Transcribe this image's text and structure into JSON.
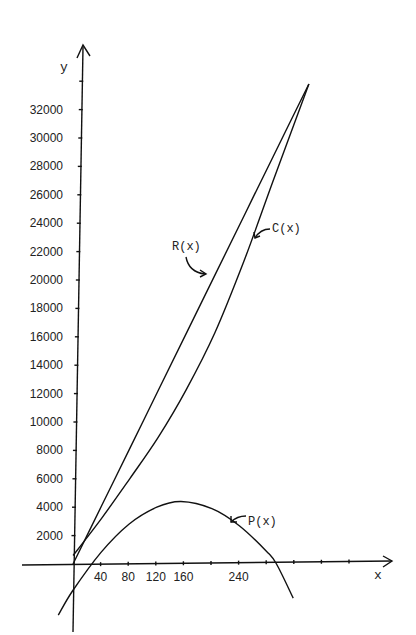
{
  "chart_data": {
    "type": "line",
    "title": "",
    "xlabel": "x",
    "ylabel": "y",
    "x_ticks": [
      40,
      80,
      120,
      160,
      240
    ],
    "x_tick_marks": [
      40,
      80,
      120,
      160,
      200,
      240,
      280,
      320,
      360,
      400
    ],
    "y_ticks": [
      2000,
      4000,
      6000,
      8000,
      10000,
      12000,
      14000,
      16000,
      18000,
      20000,
      22000,
      24000,
      26000,
      28000,
      30000,
      32000
    ],
    "xlim": [
      -25,
      430
    ],
    "ylim": [
      -4800,
      37000
    ],
    "grid": false,
    "legend": "inline curve annotations with arrows",
    "series": [
      {
        "name": "R(x)",
        "x": [
          0,
          40,
          80,
          120,
          160,
          200,
          240,
          280,
          330
        ],
        "values": [
          0,
          4100,
          8200,
          12300,
          16400,
          20500,
          24600,
          28700,
          33800
        ]
      },
      {
        "name": "C(x)",
        "x": [
          0,
          40,
          80,
          120,
          160,
          200,
          240,
          280,
          330
        ],
        "values": [
          600,
          3200,
          6000,
          8900,
          12300,
          16300,
          21300,
          26900,
          33800
        ]
      },
      {
        "name": "P(x)",
        "x": [
          -20,
          0,
          40,
          80,
          120,
          155,
          200,
          240,
          280,
          295,
          320
        ],
        "values": [
          -3600,
          -1900,
          800,
          2800,
          4000,
          4400,
          3900,
          2700,
          900,
          0,
          -2400
        ]
      }
    ],
    "annotations": [
      {
        "text": "R(x)",
        "points_to": "R(x) curve"
      },
      {
        "text": "C(x)",
        "points_to": "C(x) curve"
      },
      {
        "text": "P(x)",
        "points_to": "P(x) curve"
      }
    ]
  },
  "labels": {
    "y_axis": "y",
    "x_axis": "x",
    "R": "R(x)",
    "C": "C(x)",
    "P": "P(x)",
    "y_ticks": [
      "2000",
      "4000",
      "6000",
      "8000",
      "10000",
      "12000",
      "14000",
      "16000",
      "18000",
      "20000",
      "22000",
      "24000",
      "26000",
      "28000",
      "30000",
      "32000"
    ],
    "x_ticks": [
      "40",
      "80",
      "120",
      "160",
      "240"
    ]
  }
}
